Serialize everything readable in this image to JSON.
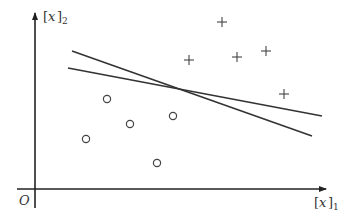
{
  "diagram": {
    "title": "",
    "axes": {
      "x_label": "x",
      "x_subscript": "1",
      "y_label": "x",
      "y_subscript": "2",
      "origin_label": "O"
    },
    "colors": {
      "axis": "#222222",
      "line": "#333333",
      "marker": "#444444"
    },
    "positive_points": [
      {
        "x": 189,
        "y": 60
      },
      {
        "x": 222,
        "y": 22
      },
      {
        "x": 237,
        "y": 57
      },
      {
        "x": 266,
        "y": 51
      },
      {
        "x": 284,
        "y": 94
      }
    ],
    "negative_points": [
      {
        "x": 107,
        "y": 99
      },
      {
        "x": 130,
        "y": 124
      },
      {
        "x": 86,
        "y": 139
      },
      {
        "x": 173,
        "y": 116
      },
      {
        "x": 157,
        "y": 163
      }
    ],
    "separating_lines": [
      {
        "x1": 72,
        "y1": 51,
        "x2": 312,
        "y2": 136
      },
      {
        "x1": 68,
        "y1": 68,
        "x2": 322,
        "y2": 116
      }
    ]
  }
}
